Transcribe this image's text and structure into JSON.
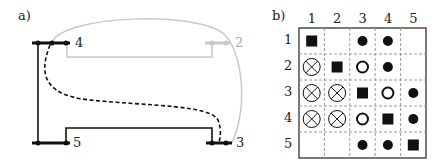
{
  "panel_a": {
    "label": "a)",
    "nodes": [
      {
        "id": "4",
        "label": "4",
        "color": "#222222"
      },
      {
        "id": "2",
        "label": "2",
        "color": "#bbbbbb"
      },
      {
        "id": "5",
        "label": "5",
        "color": "#222222"
      },
      {
        "id": "3",
        "label": "3",
        "color": "#222222"
      }
    ]
  },
  "panel_b": {
    "label": "b)",
    "col_headers": [
      "1",
      "2",
      "3",
      "4",
      "5"
    ],
    "row_headers": [
      "1",
      "2",
      "3",
      "4",
      "5"
    ],
    "matrix": [
      [
        "square",
        "empty",
        "dot",
        "dot",
        "empty"
      ],
      [
        "crossed-circle",
        "square",
        "ring",
        "dot",
        "empty"
      ],
      [
        "crossed-circle",
        "crossed-circle",
        "square",
        "ring",
        "dot"
      ],
      [
        "crossed-circle",
        "crossed-circle",
        "ring",
        "square",
        "dot"
      ],
      [
        "empty",
        "empty",
        "dot",
        "dot",
        "square"
      ]
    ]
  }
}
